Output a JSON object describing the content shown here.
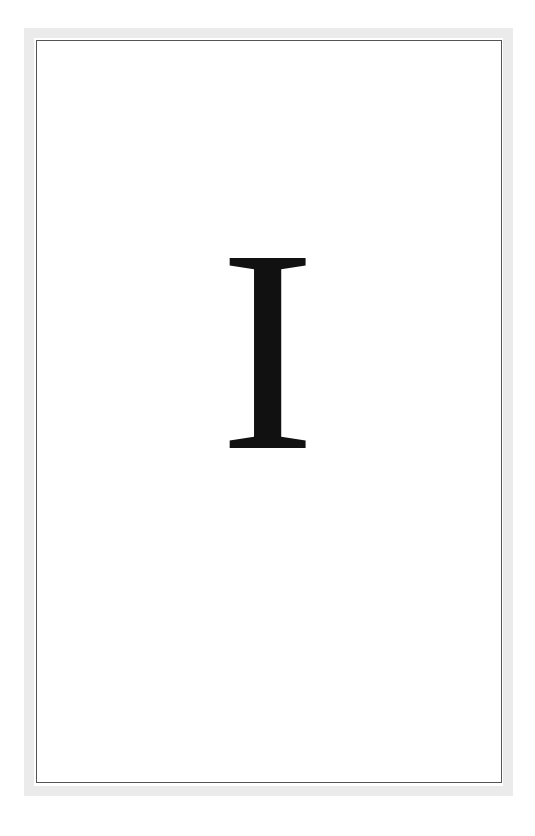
{
  "page": {
    "chapter_numeral": "I",
    "colors": {
      "frame": "#ebebeb",
      "rule": "#555555",
      "text": "#111111",
      "background": "#ffffff"
    }
  }
}
